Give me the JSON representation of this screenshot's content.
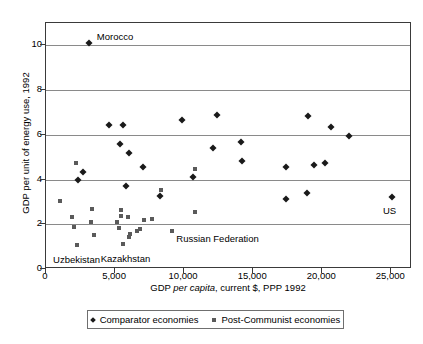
{
  "chart_data": {
    "type": "scatter",
    "title": "",
    "xlabel": "GDP per capita, current $, PPP 1992",
    "ylabel": "GDP per unit of energy use, 1992",
    "xlim": [
      0,
      26500
    ],
    "ylim": [
      0,
      11
    ],
    "grid": true,
    "legend_position": "bottom",
    "xticks": [
      0,
      5000,
      10000,
      15000,
      20000,
      25000
    ],
    "xticklabels": [
      "0",
      "5,000",
      "10,000",
      "15,000",
      "20,000",
      "25,000"
    ],
    "yticks": [
      0,
      2,
      4,
      6,
      8,
      10
    ],
    "yticklabels": [
      "0",
      "2",
      "4",
      "6",
      "8",
      "10"
    ],
    "gridlines_y": [
      2,
      4,
      6,
      8,
      10
    ],
    "series": [
      {
        "name": "Comparator economies",
        "marker": "diamond",
        "color": "#1a1a1a",
        "points": [
          [
            3100,
            10.1
          ],
          [
            2350,
            3.97
          ],
          [
            2650,
            4.32
          ],
          [
            4550,
            6.44
          ],
          [
            5600,
            6.42
          ],
          [
            5350,
            5.6
          ],
          [
            6000,
            5.2
          ],
          [
            5800,
            3.72
          ],
          [
            7000,
            4.58
          ],
          [
            8250,
            3.27
          ],
          [
            9850,
            6.68
          ],
          [
            10650,
            4.13
          ],
          [
            12350,
            6.88
          ],
          [
            12100,
            5.42
          ],
          [
            14150,
            5.68
          ],
          [
            14200,
            4.82
          ],
          [
            17350,
            4.55
          ],
          [
            17400,
            3.12
          ],
          [
            18950,
            6.82
          ],
          [
            18900,
            3.42
          ],
          [
            19400,
            4.67
          ],
          [
            20200,
            4.72
          ],
          [
            20650,
            6.33
          ],
          [
            21950,
            5.93
          ],
          [
            25050,
            3.22
          ]
        ]
      },
      {
        "name": "Post-Communist economies",
        "marker": "square",
        "color": "#5a5a5a",
        "points": [
          [
            1000,
            3.05
          ],
          [
            1850,
            2.33
          ],
          [
            2200,
            4.74
          ],
          [
            2000,
            1.87
          ],
          [
            2250,
            1.08
          ],
          [
            3350,
            2.68
          ],
          [
            3250,
            2.08
          ],
          [
            3450,
            1.51
          ],
          [
            5150,
            2.08
          ],
          [
            5250,
            1.83
          ],
          [
            5400,
            2.64
          ],
          [
            5400,
            2.35
          ],
          [
            5550,
            1.14
          ],
          [
            6000,
            1.44
          ],
          [
            6100,
            1.58
          ],
          [
            5950,
            2.32
          ],
          [
            6600,
            1.72
          ],
          [
            6800,
            1.78
          ],
          [
            7100,
            2.2
          ],
          [
            7650,
            2.22
          ],
          [
            8300,
            3.55
          ],
          [
            9150,
            1.7
          ],
          [
            10800,
            4.46
          ],
          [
            10800,
            2.55
          ]
        ]
      }
    ],
    "annotations": [
      {
        "text": "Morocco",
        "x": 3100,
        "y": 10.1
      },
      {
        "text": "US",
        "x": 25050,
        "y": 3.22
      },
      {
        "text": "Uzbekistan",
        "x": 2250,
        "y": 1.08
      },
      {
        "text": "Kazakhstan",
        "x": 5550,
        "y": 1.14
      },
      {
        "text": "Russian Federation",
        "x": 9150,
        "y": 1.7
      }
    ]
  }
}
